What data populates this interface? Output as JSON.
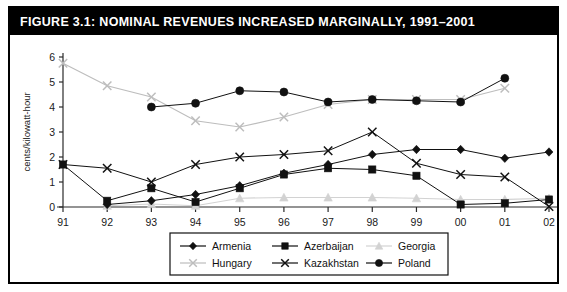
{
  "figure": {
    "title": "FIGURE 3.1:  NOMINAL REVENUES INCREASED MARGINALLY, 1991–2001"
  },
  "chart_data": {
    "type": "line",
    "title": "Nominal Revenues Increased Marginally, 1991–2001",
    "xlabel": "",
    "ylabel": "cents/kilowatt-hour",
    "categories": [
      "91",
      "92",
      "93",
      "94",
      "95",
      "96",
      "97",
      "98",
      "99",
      "00",
      "01",
      "02"
    ],
    "ylim": [
      0,
      6
    ],
    "yticks": [
      0,
      1,
      2,
      3,
      4,
      5,
      6
    ],
    "grid": false,
    "legend_position": "bottom",
    "series": [
      {
        "name": "Armenia",
        "marker": "diamond",
        "color": "#111111",
        "values": [
          null,
          0.1,
          0.25,
          0.5,
          0.85,
          1.35,
          1.7,
          2.1,
          2.3,
          2.3,
          1.95,
          2.2
        ]
      },
      {
        "name": "Azerbaijan",
        "marker": "square",
        "color": "#111111",
        "values": [
          1.7,
          0.25,
          0.75,
          0.2,
          0.75,
          1.3,
          1.55,
          1.5,
          1.25,
          0.1,
          0.15,
          0.3
        ]
      },
      {
        "name": "Georgia",
        "marker": "triangle",
        "color": "#d2d2d2",
        "values": [
          null,
          0.05,
          0.12,
          0.05,
          0.35,
          0.38,
          0.38,
          0.38,
          0.35,
          0.3,
          0.3,
          0.35
        ]
      },
      {
        "name": "Hungary",
        "marker": "x",
        "color": "#bdbdbd",
        "values": [
          5.75,
          4.85,
          4.4,
          3.45,
          3.2,
          3.6,
          4.1,
          4.3,
          4.3,
          4.3,
          4.75,
          null
        ]
      },
      {
        "name": "Kazakhstan",
        "marker": "x",
        "color": "#111111",
        "values": [
          1.7,
          1.55,
          1.0,
          1.7,
          2.0,
          2.1,
          2.25,
          3.0,
          1.75,
          1.3,
          1.2,
          0.02
        ]
      },
      {
        "name": "Poland",
        "marker": "circle",
        "color": "#111111",
        "values": [
          null,
          null,
          4.0,
          4.15,
          4.65,
          4.6,
          4.2,
          4.3,
          4.25,
          4.2,
          5.15,
          null
        ]
      }
    ]
  },
  "legend": {
    "items": [
      {
        "label": "Armenia",
        "marker": "diamond",
        "color": "#111111"
      },
      {
        "label": "Azerbaijan",
        "marker": "square",
        "color": "#111111"
      },
      {
        "label": "Georgia",
        "marker": "triangle",
        "color": "#d2d2d2"
      },
      {
        "label": "Hungary",
        "marker": "x",
        "color": "#bdbdbd"
      },
      {
        "label": "Kazakhstan",
        "marker": "x",
        "color": "#111111"
      },
      {
        "label": "Poland",
        "marker": "circle",
        "color": "#111111"
      }
    ]
  }
}
